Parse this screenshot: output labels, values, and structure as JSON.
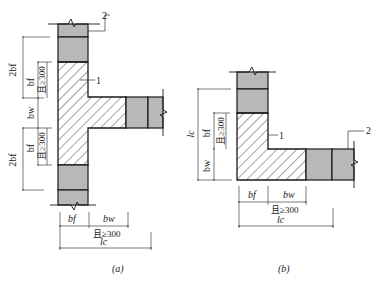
{
  "figure_a": {
    "caption": "(a)",
    "callouts": {
      "hatched_region": "1",
      "masonry_block": "2"
    },
    "left_dims": {
      "upper_outer": "2bf",
      "upper_inner": "bf",
      "upper_note": "且≥300",
      "middle": "bw",
      "lower_outer": "2bf",
      "lower_inner": "bf",
      "lower_note": "且≥300"
    },
    "bottom_dims": {
      "left": "bf",
      "right": "bw",
      "note": "且≥300",
      "total": "lc"
    }
  },
  "figure_b": {
    "caption": "(b)",
    "callouts": {
      "hatched_region": "1",
      "masonry_block": "2"
    },
    "left_dims": {
      "outer": "lc",
      "upper": "bf",
      "upper_note": "且≥300",
      "lower": "bw"
    },
    "bottom_dims": {
      "left": "bf",
      "right": "bw",
      "note": "且≥300",
      "total": "lc"
    }
  },
  "colors": {
    "block_fill": "#b8b8b8",
    "outline": "#1a1a1a",
    "hatch": "#333333",
    "dim_line": "#444444"
  }
}
